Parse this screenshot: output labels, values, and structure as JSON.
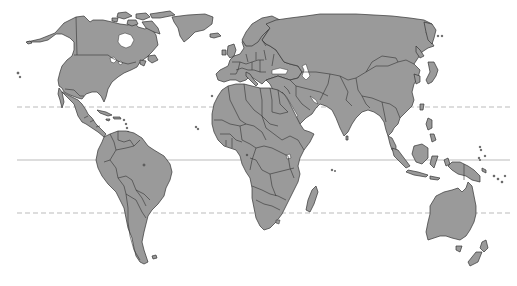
{
  "map": {
    "type": "world-political-outline",
    "projection": "equirectangular-like",
    "width": 517,
    "height": 286,
    "colors": {
      "land": "#9a9a9a",
      "border": "#333333",
      "ocean": "#ffffff",
      "latitude_line": "#aaaaaa"
    },
    "latitude_lines": [
      {
        "name": "Tropic of Cancer",
        "y": 107,
        "style": "dashed",
        "x1": 17,
        "x2": 510
      },
      {
        "name": "Equator",
        "y": 160,
        "style": "solid",
        "x1": 17,
        "x2": 510
      },
      {
        "name": "Tropic of Capricorn",
        "y": 213,
        "style": "dashed",
        "x1": 17,
        "x2": 510
      }
    ],
    "regions": [
      "North America",
      "Greenland",
      "Central America",
      "Caribbean",
      "South America",
      "Europe",
      "Africa",
      "Madagascar",
      "Middle East",
      "Asia",
      "Japan",
      "Southeast Asia",
      "Indonesia",
      "Papua New Guinea",
      "Australia",
      "New Zealand"
    ]
  },
  "top_fragment": ""
}
